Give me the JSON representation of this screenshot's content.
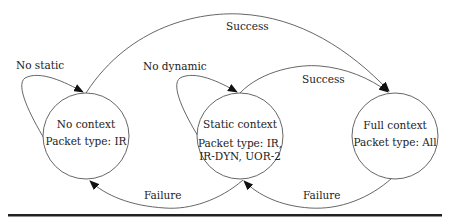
{
  "diagram": {
    "type": "state-machine",
    "states": [
      {
        "id": "no_context",
        "title": "No context",
        "packet": "Packet type: IR",
        "packet2": ""
      },
      {
        "id": "static_context",
        "title": "Static context",
        "packet": "Packet type: IR,",
        "packet2": "IR-DYN, UOR-2"
      },
      {
        "id": "full_context",
        "title": "Full context",
        "packet": "Packet type: All",
        "packet2": ""
      }
    ],
    "transitions": [
      {
        "from": "no_context",
        "to": "no_context",
        "label": "No static"
      },
      {
        "from": "static_context",
        "to": "static_context",
        "label": "No dynamic"
      },
      {
        "from": "no_context",
        "to": "full_context",
        "label": "Success"
      },
      {
        "from": "static_context",
        "to": "full_context",
        "label": "Success"
      },
      {
        "from": "static_context",
        "to": "no_context",
        "label": "Failure"
      },
      {
        "from": "full_context",
        "to": "static_context",
        "label": "Failure"
      }
    ]
  },
  "colors": {
    "stroke": "#555555",
    "text": "#222222",
    "rule": "#222222"
  }
}
